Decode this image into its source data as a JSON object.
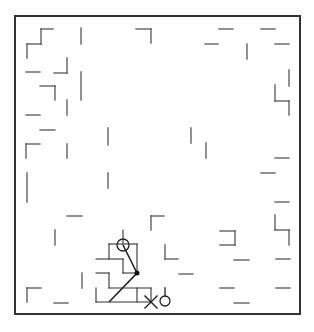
{
  "game": {
    "type": "maze-navigation",
    "board": {
      "x": 15,
      "y": 16,
      "width": 285,
      "height": 298,
      "border_color": "#333333",
      "background": "#ffffff"
    },
    "wall_color": "#555555",
    "path_color": "#222222",
    "walls": [
      [
        41,
        29,
        53,
        29
      ],
      [
        41,
        29,
        41,
        44
      ],
      [
        27,
        44,
        41,
        44
      ],
      [
        27,
        44,
        27,
        58
      ],
      [
        81,
        28,
        81,
        44
      ],
      [
        136,
        29,
        151,
        29
      ],
      [
        151,
        29,
        151,
        43
      ],
      [
        219,
        29,
        233,
        29
      ],
      [
        261,
        29,
        275,
        29
      ],
      [
        205,
        44,
        218,
        44
      ],
      [
        247,
        44,
        247,
        59
      ],
      [
        275,
        44,
        289,
        44
      ],
      [
        26,
        72,
        40,
        72
      ],
      [
        54,
        73,
        67,
        73
      ],
      [
        67,
        58,
        67,
        73
      ],
      [
        81,
        72,
        81,
        100
      ],
      [
        40,
        86,
        55,
        86
      ],
      [
        55,
        86,
        55,
        100
      ],
      [
        289,
        70,
        289,
        86
      ],
      [
        275,
        85,
        275,
        101
      ],
      [
        275,
        101,
        289,
        101
      ],
      [
        289,
        101,
        289,
        115
      ],
      [
        67,
        100,
        67,
        115
      ],
      [
        26,
        115,
        40,
        115
      ],
      [
        40,
        130,
        55,
        130
      ],
      [
        108,
        128,
        108,
        145
      ],
      [
        191,
        128,
        191,
        143
      ],
      [
        206,
        143,
        206,
        158
      ],
      [
        26,
        144,
        40,
        144
      ],
      [
        26,
        144,
        26,
        158
      ],
      [
        67,
        144,
        67,
        158
      ],
      [
        275,
        158,
        289,
        158
      ],
      [
        261,
        173,
        275,
        173
      ],
      [
        27,
        173,
        27,
        202
      ],
      [
        108,
        173,
        108,
        188
      ],
      [
        275,
        202,
        289,
        202
      ],
      [
        67,
        216,
        82,
        216
      ],
      [
        151,
        216,
        164,
        216
      ],
      [
        151,
        216,
        151,
        230
      ],
      [
        275,
        215,
        275,
        230
      ],
      [
        275,
        230,
        289,
        230
      ],
      [
        289,
        230,
        289,
        245
      ],
      [
        220,
        231,
        235,
        231
      ],
      [
        235,
        231,
        235,
        245
      ],
      [
        220,
        245,
        235,
        245
      ],
      [
        55,
        230,
        55,
        245
      ],
      [
        165,
        245,
        165,
        259
      ],
      [
        165,
        259,
        178,
        259
      ],
      [
        234,
        260,
        249,
        260
      ],
      [
        276,
        259,
        290,
        259
      ],
      [
        179,
        274,
        193,
        274
      ],
      [
        82,
        273,
        82,
        288
      ],
      [
        220,
        288,
        234,
        288
      ],
      [
        276,
        288,
        290,
        288
      ],
      [
        27,
        288,
        41,
        288
      ],
      [
        27,
        288,
        27,
        302
      ],
      [
        54,
        303,
        68,
        303
      ],
      [
        234,
        303,
        249,
        303
      ]
    ],
    "explored_cells": [
      [
        123,
        230,
        123,
        244
      ],
      [
        109,
        244,
        137,
        244
      ],
      [
        109,
        244,
        109,
        259
      ],
      [
        137,
        244,
        137,
        273
      ],
      [
        96,
        259,
        123,
        259
      ],
      [
        123,
        259,
        123,
        273
      ],
      [
        123,
        273,
        137,
        273
      ],
      [
        96,
        273,
        109,
        273
      ],
      [
        109,
        273,
        109,
        288
      ],
      [
        96,
        288,
        96,
        302
      ],
      [
        109,
        288,
        151,
        288
      ],
      [
        137,
        288,
        137,
        302
      ],
      [
        151,
        288,
        151,
        302
      ],
      [
        96,
        302,
        151,
        302
      ]
    ],
    "agent_path": [
      [
        123,
        245
      ],
      [
        137,
        273
      ],
      [
        109,
        302
      ]
    ],
    "start_marker": {
      "x": 123,
      "y": 245,
      "r": 6,
      "label": "start"
    },
    "waypoint": {
      "x": 137,
      "y": 273,
      "r": 2.5
    },
    "agent_marker": {
      "x": 151,
      "y": 302,
      "size": 6,
      "symbol": "×"
    },
    "goal_marker": {
      "x": 165,
      "y": 301,
      "r": 5,
      "stem": [
        165,
        288,
        165,
        296
      ]
    }
  }
}
